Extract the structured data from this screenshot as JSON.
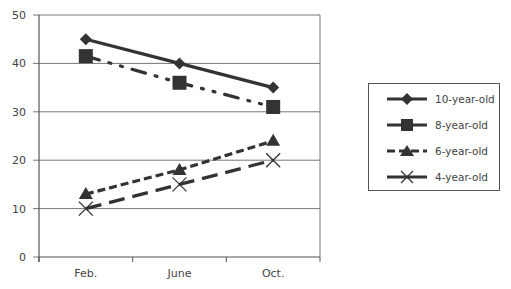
{
  "chart_data": {
    "type": "line",
    "title": "",
    "xlabel": "",
    "ylabel": "",
    "categories": [
      "Feb.",
      "June",
      "Oct."
    ],
    "ylim": [
      0,
      50
    ],
    "yticks": [
      0,
      10,
      20,
      30,
      40,
      50
    ],
    "grid": true,
    "legend_position": "right",
    "series": [
      {
        "name": "10-year-old",
        "values": [
          45,
          40,
          35
        ],
        "marker": "diamond",
        "line": "solid"
      },
      {
        "name": "8-year-old",
        "values": [
          41.5,
          36,
          31
        ],
        "marker": "square",
        "line": "dash-dot-dot"
      },
      {
        "name": "6-year-old",
        "values": [
          13,
          18,
          24
        ],
        "marker": "triangle",
        "line": "short-dash"
      },
      {
        "name": "4-year-old",
        "values": [
          10,
          15,
          20
        ],
        "marker": "x",
        "line": "long-dash"
      }
    ]
  },
  "axis": {
    "y_labels": [
      "0",
      "10",
      "20",
      "30",
      "40",
      "50"
    ],
    "x_labels": [
      "Feb.",
      "June",
      "Oct."
    ]
  },
  "legend": {
    "items": [
      "10-year-old",
      "8-year-old",
      "6-year-old",
      "4-year-old"
    ]
  },
  "colors": {
    "line": "#333333",
    "grid": "#777777",
    "text": "#444444"
  }
}
